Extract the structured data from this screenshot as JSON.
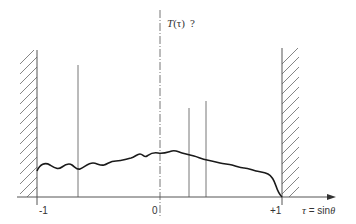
{
  "diagram": {
    "title_label": "T(τ) ?",
    "title_func": "T",
    "title_arg": "(τ)",
    "title_q": "?",
    "axis": {
      "label_var": "τ",
      "label_eq": " = sin",
      "label_theta": "θ",
      "ticks": [
        {
          "label": "-1",
          "value": -1
        },
        {
          "label": "0",
          "value": 0
        },
        {
          "label": "+1",
          "value": 1
        }
      ]
    },
    "walls": [
      {
        "name": "left-wall",
        "position": -1,
        "hatch_side": "left"
      },
      {
        "name": "right-wall",
        "position": 1,
        "hatch_side": "right"
      }
    ],
    "center_line": {
      "position": 0,
      "style": "dash-dot"
    },
    "vertical_markers": [
      {
        "position": -0.67
      },
      {
        "position": 0.24
      },
      {
        "position": 0.38
      }
    ],
    "curve": {
      "description": "Wavy distribution T(τ), rising from left wall to a peak near τ≈0.2, then decreasing and dropping to zero at τ=+1"
    },
    "colors": {
      "line": "#555555",
      "curve": "#1a1a1a",
      "hatch": "#666666"
    }
  }
}
